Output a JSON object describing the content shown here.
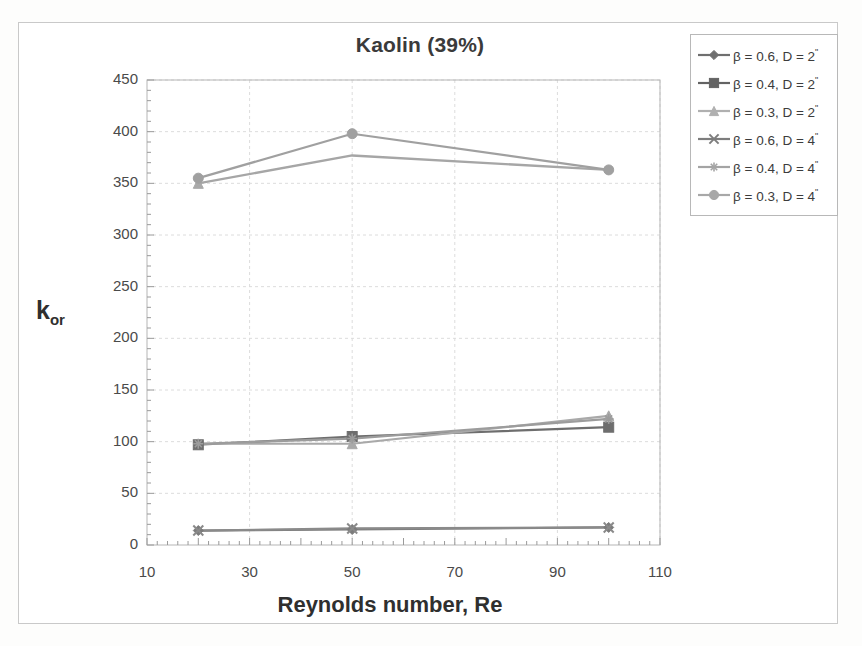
{
  "figure": {
    "title": "Kaolin (39%)",
    "y_axis_title_main": "k",
    "y_axis_title_sub": "or",
    "x_axis_title": "Reynolds number, Re"
  },
  "chart_data": {
    "type": "line",
    "title": "Kaolin (39%)",
    "xlabel": "Reynolds number, Re",
    "ylabel": "k_or",
    "xlim": [
      10,
      110
    ],
    "ylim": [
      0,
      450
    ],
    "xticks": [
      10,
      30,
      50,
      70,
      90,
      110
    ],
    "yticks": [
      0,
      50,
      100,
      150,
      200,
      250,
      300,
      350,
      400,
      450
    ],
    "grid": true,
    "legend_position": "top-right-outside",
    "x": [
      20,
      50,
      100
    ],
    "series": [
      {
        "name": "β = 0.6, D = 2 \"",
        "marker": "diamond",
        "color": "#7b7b7b",
        "values": [
          14,
          15,
          17
        ]
      },
      {
        "name": "β = 0.4, D = 2 \"",
        "marker": "square",
        "color": "#6e6e6e",
        "values": [
          97,
          105,
          114
        ]
      },
      {
        "name": "β = 0.3, D = 2 \"",
        "marker": "triangle",
        "color": "#a9a9a9",
        "values": [
          350,
          98,
          125
        ]
      },
      {
        "name": "β = 0.6, D = 4 \"",
        "marker": "x",
        "color": "#8a8a8a",
        "values": [
          14,
          16,
          17
        ]
      },
      {
        "name": "β = 0.4, D = 4 \"",
        "marker": "star",
        "color": "#9c9c9c",
        "values": [
          98,
          103,
          122
        ]
      },
      {
        "name": "β = 0.3, D = 4 \"",
        "marker": "circle",
        "color": "#a0a0a0",
        "values": [
          355,
          398,
          363
        ]
      }
    ],
    "extra_series": [
      {
        "name": "upper-band-lower",
        "comment": "second high curve through 350, 377, 363",
        "values": [
          350,
          377,
          363
        ]
      }
    ]
  },
  "legend": {
    "items": [
      {
        "label": "β = 0.6, D = 2 \"",
        "marker": "diamond",
        "color": "#6f6f6f"
      },
      {
        "label": "β = 0.4, D = 2 \"",
        "marker": "square",
        "color": "#636363"
      },
      {
        "label": "β = 0.3, D = 2 \"",
        "marker": "triangle",
        "color": "#b0b0b0"
      },
      {
        "label": "β = 0.6, D = 4 \"",
        "marker": "x",
        "color": "#7d7d7d"
      },
      {
        "label": "β = 0.4, D = 4 \"",
        "marker": "star",
        "color": "#a4a4a4"
      },
      {
        "label": "β = 0.3, D = 4 \"",
        "marker": "circle",
        "color": "#a8a8a8"
      }
    ]
  },
  "axes": {
    "y_tick_labels": [
      "450",
      "400",
      "350",
      "300",
      "250",
      "200",
      "150",
      "100",
      "50",
      "0"
    ],
    "x_tick_labels": [
      "10",
      "30",
      "50",
      "70",
      "90",
      "110"
    ]
  }
}
